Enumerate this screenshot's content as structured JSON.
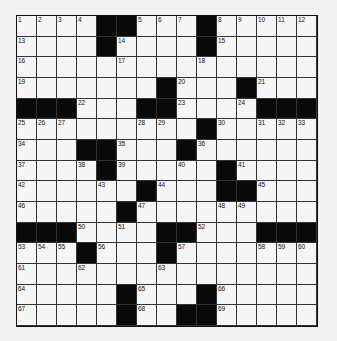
{
  "puzzle": {
    "size": 15,
    "rows": [
      [
        "1",
        "2",
        "3",
        "4",
        "#",
        "#",
        "5",
        "6",
        "7",
        "#",
        "8",
        "9",
        "10",
        "11",
        "12"
      ],
      [
        "13",
        "",
        "",
        "",
        "#",
        "14",
        "",
        "",
        "",
        "#",
        "15",
        "",
        "",
        "",
        ""
      ],
      [
        "16",
        "",
        "",
        "",
        "",
        "17",
        "",
        "",
        "",
        "18",
        "",
        "",
        "",
        "",
        ""
      ],
      [
        "19",
        "",
        "",
        "",
        "",
        "",
        "",
        "#",
        "20",
        "",
        "",
        "#",
        "21",
        "",
        ""
      ],
      [
        "#",
        "#",
        "#",
        "22",
        "",
        "",
        "#",
        "#",
        "23",
        "",
        "",
        "24",
        "#",
        "#",
        "#"
      ],
      [
        "25",
        "26",
        "27",
        "",
        "",
        "",
        "28",
        "29",
        "",
        "#",
        "30",
        "",
        "31",
        "32",
        "33"
      ],
      [
        "34",
        "",
        "",
        "#",
        "#",
        "35",
        "",
        "",
        "#",
        "36",
        "",
        "",
        "",
        "",
        ""
      ],
      [
        "37",
        "",
        "",
        "38",
        "#",
        "39",
        "",
        "",
        "40",
        "",
        "#",
        "41",
        "",
        "",
        ""
      ],
      [
        "42",
        "",
        "",
        "",
        "43",
        "",
        "#",
        "44",
        "",
        "",
        "#",
        "#",
        "45",
        "",
        ""
      ],
      [
        "46",
        "",
        "",
        "",
        "",
        "#",
        "47",
        "",
        "",
        "",
        "48",
        "49",
        "",
        "",
        ""
      ],
      [
        "#",
        "#",
        "#",
        "50",
        "",
        "51",
        "",
        "#",
        "#",
        "52",
        "",
        "",
        "#",
        "#",
        "#"
      ],
      [
        "53",
        "54",
        "55",
        "#",
        "56",
        "",
        "",
        "#",
        "57",
        "",
        "",
        "",
        "58",
        "59",
        "60"
      ],
      [
        "61",
        "",
        "",
        "62",
        "",
        "",
        "",
        "63",
        "",
        "",
        "",
        "",
        "",
        "",
        ""
      ],
      [
        "64",
        "",
        "",
        "",
        "",
        "#",
        "65",
        "",
        "",
        "#",
        "66",
        "",
        "",
        "",
        ""
      ],
      [
        "67",
        "",
        "",
        "",
        "",
        "#",
        "68",
        "",
        "#",
        "#",
        "69",
        "",
        "",
        "",
        ""
      ]
    ]
  }
}
